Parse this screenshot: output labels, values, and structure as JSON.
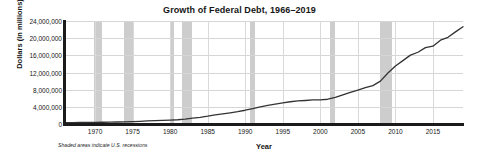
{
  "chart_data": {
    "type": "line",
    "title": "Growth of Federal Debt, 1966–2019",
    "xlabel": "Year",
    "ylabel": "Dollars (in millions)",
    "footnote": "Shaded areas indicate U.S. recessions",
    "grid": "horizontal",
    "legend": "none",
    "xlim": [
      1966,
      2019
    ],
    "ylim": [
      0,
      24000000
    ],
    "ytick_labels": [
      "24,000,000",
      "20,000,000",
      "16,000,000",
      "12,000,000",
      "8,000,000",
      "4,000,000",
      "0"
    ],
    "yticks": [
      24000000,
      20000000,
      16000000,
      12000000,
      8000000,
      4000000,
      0
    ],
    "xtick_labels": [
      "1970",
      "1975",
      "1980",
      "1985",
      "1990",
      "1995",
      "2000",
      "2005",
      "2010",
      "2015"
    ],
    "xticks": [
      1970,
      1975,
      1980,
      1985,
      1990,
      1995,
      2000,
      2005,
      2010,
      2015
    ],
    "series": [
      {
        "name": "Federal Debt",
        "color": "#333333",
        "x": [
          1966,
          1967,
          1968,
          1969,
          1970,
          1971,
          1972,
          1973,
          1974,
          1975,
          1976,
          1977,
          1978,
          1979,
          1980,
          1981,
          1982,
          1983,
          1984,
          1985,
          1986,
          1987,
          1988,
          1989,
          1990,
          1991,
          1992,
          1993,
          1994,
          1995,
          1996,
          1997,
          1998,
          1999,
          2000,
          2001,
          2002,
          2003,
          2004,
          2005,
          2006,
          2007,
          2008,
          2009,
          2010,
          2011,
          2012,
          2013,
          2014,
          2015,
          2016,
          2017,
          2018,
          2019
        ],
        "values": [
          320000,
          341000,
          370000,
          367000,
          381000,
          408000,
          436000,
          466000,
          484000,
          541000,
          629000,
          706000,
          777000,
          829000,
          909000,
          995000,
          1137000,
          1372000,
          1565000,
          1817000,
          2120000,
          2346000,
          2601000,
          2868000,
          3206000,
          3598000,
          4002000,
          4351000,
          4643000,
          4921000,
          5181000,
          5369000,
          5478000,
          5606000,
          5629000,
          5770000,
          6198000,
          6760000,
          7355000,
          7905000,
          8451000,
          8951000,
          9986000,
          11876000,
          13529000,
          14764000,
          16051000,
          16719000,
          17794000,
          18120000,
          19539000,
          20205000,
          21462000,
          22669000
        ]
      }
    ],
    "recessions": [
      {
        "label": "1969–1970",
        "start": 1969.92,
        "end": 1970.92
      },
      {
        "label": "1973–1975",
        "start": 1973.92,
        "end": 1975.25
      },
      {
        "label": "1980",
        "start": 1980.08,
        "end": 1980.58
      },
      {
        "label": "1981–1982",
        "start": 1981.58,
        "end": 1982.92
      },
      {
        "label": "1990–1991",
        "start": 1990.58,
        "end": 1991.25
      },
      {
        "label": "2001",
        "start": 2001.25,
        "end": 2001.92
      },
      {
        "label": "2007–2009",
        "start": 2007.92,
        "end": 2009.5
      }
    ]
  }
}
